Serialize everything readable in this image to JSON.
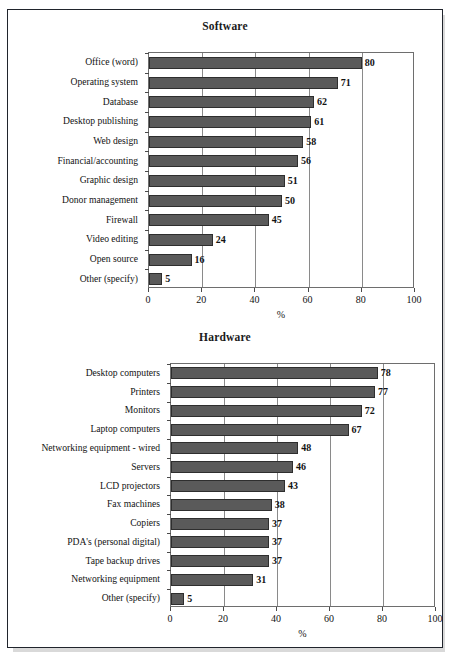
{
  "document": {
    "background_color": "#ffffff",
    "border_color": "#20242c",
    "bar_color": "#5a5a5a",
    "bar_border_color": "#2e2e2e",
    "grid_color": "#8a8a8a"
  },
  "chart_data": [
    {
      "type": "bar",
      "orientation": "horizontal",
      "title": "Software",
      "xlabel": "%",
      "ylabel": "",
      "xlim": [
        0,
        100
      ],
      "xticks": [
        "0",
        "20",
        "40",
        "60",
        "80",
        "100"
      ],
      "grid": true,
      "legend": "none",
      "categories": [
        "Office (word)",
        "Operating system",
        "Database",
        "Desktop publishing",
        "Web design",
        "Financial/accounting",
        "Graphic design",
        "Donor management",
        "Firewall",
        "Video editing",
        "Open source",
        "Other (specify)"
      ],
      "values": [
        80,
        71,
        62,
        61,
        58,
        56,
        51,
        50,
        45,
        24,
        16,
        5
      ],
      "data_labels": [
        "80",
        "71",
        "62",
        "61",
        "58",
        "56",
        "51",
        "50",
        "45",
        "24",
        "16",
        "5"
      ]
    },
    {
      "type": "bar",
      "orientation": "horizontal",
      "title": "Hardware",
      "xlabel": "%",
      "ylabel": "",
      "xlim": [
        0,
        100
      ],
      "xticks": [
        "0",
        "20",
        "40",
        "60",
        "80",
        "100"
      ],
      "grid": true,
      "legend": "none",
      "categories": [
        "Desktop computers",
        "Printers",
        "Monitors",
        "Laptop computers",
        "Networking equipment - wired",
        "Servers",
        "LCD projectors",
        "Fax machines",
        "Copiers",
        "PDA's (personal digital)",
        "Tape backup drives",
        "Networking equipment",
        "Other (specify)"
      ],
      "values": [
        78,
        77,
        72,
        67,
        48,
        46,
        43,
        38,
        37,
        37,
        37,
        31,
        5
      ],
      "data_labels": [
        "78",
        "77",
        "72",
        "67",
        "48",
        "46",
        "43",
        "38",
        "37",
        "37",
        "37",
        "31",
        "5"
      ]
    }
  ]
}
